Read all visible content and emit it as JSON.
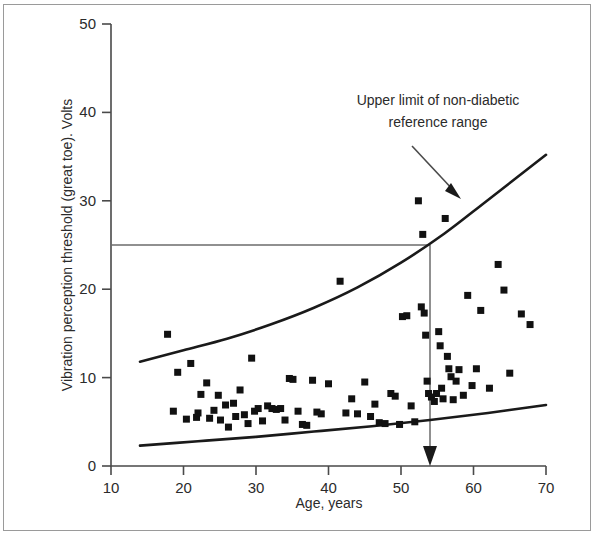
{
  "chart_data": {
    "type": "scatter",
    "title": "",
    "xlabel": "Age, years",
    "ylabel": "Vibration perception threshold (great toe). Volts",
    "xlim": [
      10,
      70
    ],
    "ylim": [
      0,
      50
    ],
    "xticks": [
      10,
      20,
      30,
      40,
      50,
      60,
      70
    ],
    "yticks": [
      0,
      10,
      20,
      30,
      40,
      50
    ],
    "grid": false,
    "legend": "none",
    "point_marker": "filled-square",
    "point_color": "#111111",
    "curve_color": "#1a1a1a",
    "guide_color": "#6b6b6b",
    "series": [
      {
        "name": "Diabetic patients",
        "points": [
          [
            17.8,
            14.9
          ],
          [
            19.2,
            10.6
          ],
          [
            18.6,
            6.2
          ],
          [
            20.4,
            5.3
          ],
          [
            21.0,
            11.6
          ],
          [
            21.8,
            5.5
          ],
          [
            22.4,
            8.1
          ],
          [
            22.0,
            6.0
          ],
          [
            23.2,
            9.4
          ],
          [
            23.6,
            5.4
          ],
          [
            24.2,
            6.3
          ],
          [
            24.8,
            8.0
          ],
          [
            25.1,
            5.2
          ],
          [
            25.8,
            6.9
          ],
          [
            26.2,
            4.4
          ],
          [
            26.9,
            7.1
          ],
          [
            27.2,
            5.6
          ],
          [
            27.8,
            8.6
          ],
          [
            28.4,
            5.8
          ],
          [
            28.9,
            4.8
          ],
          [
            29.4,
            12.2
          ],
          [
            29.8,
            6.2
          ],
          [
            30.3,
            6.5
          ],
          [
            30.9,
            5.1
          ],
          [
            31.6,
            6.8
          ],
          [
            32.2,
            6.5
          ],
          [
            32.8,
            6.4
          ],
          [
            33.4,
            6.5
          ],
          [
            34.0,
            5.2
          ],
          [
            34.6,
            9.9
          ],
          [
            35.1,
            9.8
          ],
          [
            35.8,
            6.2
          ],
          [
            36.4,
            4.7
          ],
          [
            37.0,
            4.6
          ],
          [
            37.8,
            9.7
          ],
          [
            38.4,
            6.1
          ],
          [
            39.0,
            5.9
          ],
          [
            40.0,
            9.3
          ],
          [
            41.6,
            20.9
          ],
          [
            42.4,
            6.0
          ],
          [
            43.2,
            7.6
          ],
          [
            44.0,
            5.9
          ],
          [
            45.0,
            9.5
          ],
          [
            45.8,
            5.6
          ],
          [
            46.4,
            7.0
          ],
          [
            47.0,
            4.9
          ],
          [
            47.8,
            4.8
          ],
          [
            48.6,
            8.2
          ],
          [
            49.2,
            7.9
          ],
          [
            49.8,
            4.7
          ],
          [
            50.2,
            16.9
          ],
          [
            50.8,
            17.0
          ],
          [
            51.4,
            6.8
          ],
          [
            51.9,
            5.0
          ],
          [
            52.4,
            30.0
          ],
          [
            52.8,
            18.0
          ],
          [
            53.0,
            26.2
          ],
          [
            53.2,
            17.3
          ],
          [
            53.4,
            14.8
          ],
          [
            53.6,
            9.6
          ],
          [
            53.8,
            8.2
          ],
          [
            54.2,
            7.8
          ],
          [
            54.6,
            7.3
          ],
          [
            54.9,
            8.2
          ],
          [
            55.2,
            15.2
          ],
          [
            55.4,
            13.6
          ],
          [
            55.6,
            8.8
          ],
          [
            55.8,
            7.6
          ],
          [
            56.1,
            28.0
          ],
          [
            56.4,
            12.4
          ],
          [
            56.6,
            11.0
          ],
          [
            56.9,
            10.1
          ],
          [
            57.2,
            7.5
          ],
          [
            57.6,
            9.6
          ],
          [
            58.0,
            10.9
          ],
          [
            58.6,
            8.0
          ],
          [
            59.2,
            19.3
          ],
          [
            59.8,
            9.1
          ],
          [
            60.4,
            11.0
          ],
          [
            61.0,
            17.6
          ],
          [
            62.2,
            8.8
          ],
          [
            63.4,
            22.8
          ],
          [
            64.2,
            19.9
          ],
          [
            65.0,
            10.5
          ],
          [
            66.6,
            17.2
          ],
          [
            67.8,
            16.0
          ]
        ]
      }
    ],
    "reference_curves": [
      {
        "name": "Upper limit of non-diabetic reference range",
        "x": [
          14,
          20,
          26,
          32,
          38,
          44,
          50,
          56,
          62,
          70
        ],
        "y": [
          11.8,
          13.1,
          14.4,
          16.0,
          17.9,
          20.2,
          23.0,
          26.3,
          30.1,
          35.2
        ]
      },
      {
        "name": "Lower limit of non-diabetic reference range",
        "x": [
          14,
          22,
          30,
          38,
          46,
          54,
          62,
          70
        ],
        "y": [
          2.3,
          2.8,
          3.3,
          3.9,
          4.5,
          5.2,
          6.0,
          6.9
        ]
      }
    ],
    "annotations": [
      {
        "name": "upper-limit-callout",
        "text_line1": "Upper limit of non-diabetic",
        "text_line2": "reference range",
        "arrow_from": [
          44.5,
          35.5
        ],
        "arrow_to": [
          52.5,
          28.5
        ]
      },
      {
        "name": "threshold-indicator",
        "threshold_value": 25,
        "age_at_threshold": 54,
        "description": "Horizontal line at 25 Volts dropping to age 54"
      }
    ]
  },
  "axes": {
    "y_title": "Vibration perception threshold (great toe). Volts",
    "x_title": "Age, years",
    "x_tick_labels": [
      "10",
      "20",
      "30",
      "40",
      "50",
      "60",
      "70"
    ],
    "y_tick_labels": [
      "0",
      "10",
      "20",
      "30",
      "40",
      "50"
    ]
  },
  "annotation": {
    "line1": "Upper limit of non-diabetic",
    "line2": "reference range"
  }
}
